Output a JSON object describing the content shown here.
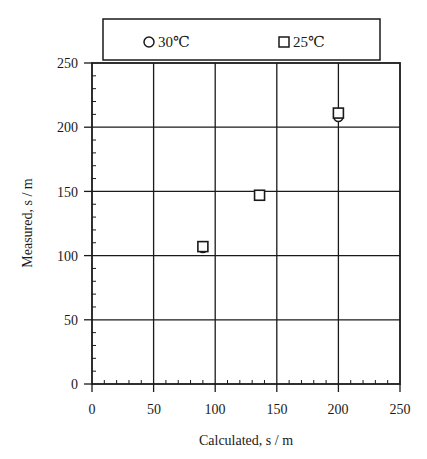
{
  "chart_data": {
    "type": "scatter",
    "title": "",
    "xlabel": "Calculated,  s / m",
    "ylabel": "Measured,  s / m",
    "xlim": [
      0,
      250
    ],
    "ylim": [
      0,
      250
    ],
    "xticks": [
      0,
      50,
      100,
      150,
      200,
      250
    ],
    "yticks": [
      0,
      50,
      100,
      150,
      200,
      250
    ],
    "minor_tick_step": 10,
    "grid": true,
    "legend_position": "top, above plot",
    "series": [
      {
        "name": "30℃",
        "marker": "circle",
        "points": [
          {
            "x": 90,
            "y": 106
          },
          {
            "x": 136,
            "y": 147
          },
          {
            "x": 200,
            "y": 208
          }
        ]
      },
      {
        "name": "25℃",
        "marker": "square",
        "points": [
          {
            "x": 90,
            "y": 107
          },
          {
            "x": 136,
            "y": 147
          },
          {
            "x": 200,
            "y": 211
          }
        ]
      }
    ]
  },
  "legend": {
    "items": [
      {
        "label": "30℃",
        "marker": "circle"
      },
      {
        "label": "25℃",
        "marker": "square"
      }
    ]
  },
  "axes": {
    "x_title": "Calculated,  s / m",
    "y_title": "Measured,  s / m",
    "x_tick_labels": [
      "0",
      "50",
      "100",
      "150",
      "200",
      "250"
    ],
    "y_tick_labels": [
      "0",
      "50",
      "100",
      "150",
      "200",
      "250"
    ]
  },
  "colors": {
    "ink": "#1a1a1a",
    "background": "#ffffff"
  }
}
